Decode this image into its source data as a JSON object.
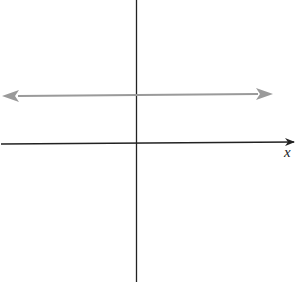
{
  "diagram": {
    "type": "coordinate-plane-horizontal-line",
    "x_axis_label": "x",
    "y_axis_label": "",
    "horizontal_line": {
      "description": "horizontal line above x-axis with arrows on both ends",
      "color": "#9a9a9a"
    },
    "axis_color": "#222222"
  }
}
